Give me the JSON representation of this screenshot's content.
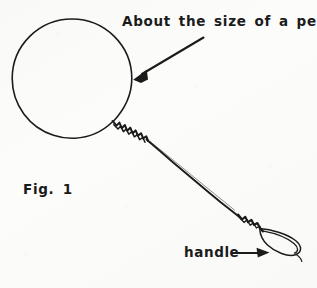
{
  "figure": {
    "title": "Fig. 1",
    "background_color": "#fcfcfb",
    "ink_color": "#1b1b1b"
  },
  "labels": {
    "penny_caption": "About the size of a penny",
    "figure_number": "Fig. 1",
    "handle_caption": "handle"
  },
  "annotations": [
    {
      "name": "penny-arrow",
      "text": "About the size of a penny",
      "points_to": "loop-circle",
      "arrow_from": [
        203,
        38
      ],
      "arrow_to": [
        134,
        79
      ]
    },
    {
      "name": "handle-arrow",
      "text": "handle",
      "points_to": "handle-loop",
      "arrow_from": [
        232,
        253
      ],
      "arrow_to": [
        268,
        253
      ]
    }
  ],
  "geometry": {
    "loop_circle": {
      "cx": 72,
      "cy": 78,
      "r": 60
    },
    "twist_start": [
      113,
      122
    ],
    "twist_end": [
      140,
      148
    ],
    "shaft_end": [
      245,
      213
    ],
    "handle_loop": {
      "cx": 281,
      "cy": 244,
      "rx": 21,
      "ry": 8,
      "rotation_deg": 28
    }
  }
}
